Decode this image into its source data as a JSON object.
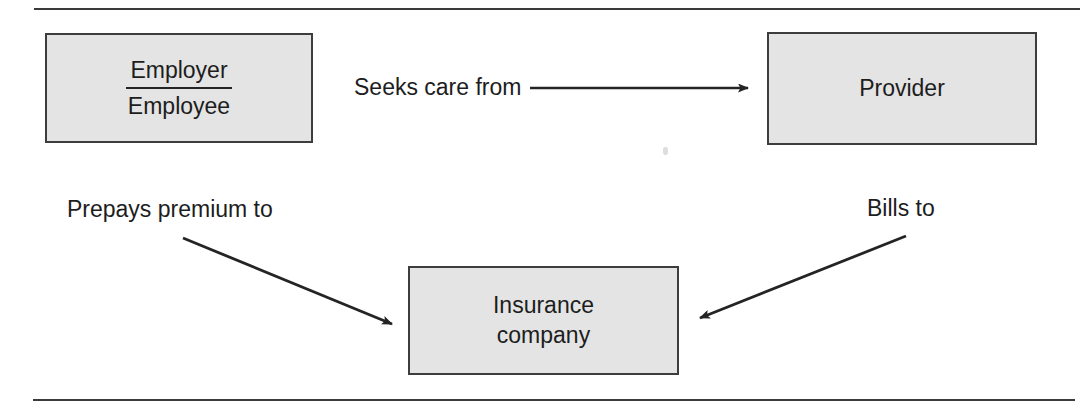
{
  "diagram": {
    "background_color": "#ffffff",
    "box_fill_color": "#e4e4e4",
    "box_border_color": "#3d3d3d",
    "line_color": "#242424",
    "text_color": "#1d1d1d",
    "rules": {
      "top_rule": "horizontal-rule",
      "bottom_rule": "horizontal-rule"
    },
    "nodes": [
      {
        "id": "employer-employee",
        "kind": "fraction-box",
        "numerator": "Employer",
        "denominator": "Employee",
        "x": 45,
        "y": 33,
        "width": 268,
        "height": 110
      },
      {
        "id": "provider",
        "kind": "box",
        "label": "Provider",
        "x": 767,
        "y": 32,
        "width": 270,
        "height": 113
      },
      {
        "id": "insurance-company",
        "kind": "box",
        "line1": "Insurance",
        "line2": "company",
        "x": 408,
        "y": 266,
        "width": 271,
        "height": 109
      }
    ],
    "edges": [
      {
        "id": "seeks-care-from",
        "label": "Seeks care from",
        "from": "employer-employee",
        "to": "provider",
        "direction": "right",
        "style": "straight-horizontal-arrow"
      },
      {
        "id": "prepays-premium-to",
        "label": "Prepays premium to",
        "from": "employer-employee",
        "to": "insurance-company",
        "direction": "down-right",
        "style": "diagonal-arrow"
      },
      {
        "id": "bills-to",
        "label": "Bills to",
        "from": "provider",
        "to": "insurance-company",
        "direction": "down-left",
        "style": "diagonal-arrow"
      }
    ]
  }
}
